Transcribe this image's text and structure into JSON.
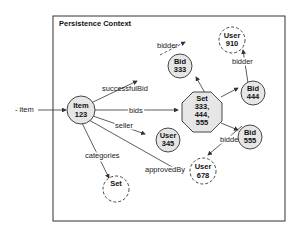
{
  "diagram": {
    "container_title": "Persistence Context",
    "external_label": "- item",
    "nodes": {
      "item": {
        "l1": "Item",
        "l2": "123"
      },
      "bid333": {
        "l1": "Bid",
        "l2": "333"
      },
      "user910": {
        "l1": "User",
        "l2": "910"
      },
      "set": {
        "l1": "Set",
        "l2": "333,",
        "l3": "444,",
        "l4": "555"
      },
      "bid444": {
        "l1": "Bid",
        "l2": "444"
      },
      "bid555": {
        "l1": "Bid",
        "l2": "555"
      },
      "user345": {
        "l1": "User",
        "l2": "345"
      },
      "user678": {
        "l1": "User",
        "l2": "678"
      },
      "categories_set": {
        "l1": "Set"
      }
    },
    "edges": {
      "successfulBid": "successfulBid",
      "bids": "bids",
      "seller": "seller",
      "categories": "categories",
      "approvedBy": "approvedBy",
      "bidder_333": "bidder",
      "bidder_444": "bidder",
      "bidder_555": "bidder"
    },
    "colors": {
      "node_fill": "#e6e6e6",
      "stroke": "#333333"
    }
  }
}
